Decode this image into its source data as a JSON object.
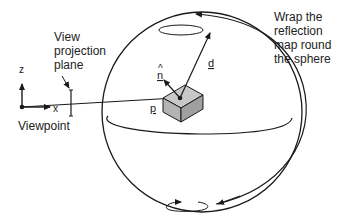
{
  "diagram": {
    "labels": {
      "view_projection_plane": [
        "View",
        "projection",
        "plane"
      ],
      "viewpoint": "Viewpoint",
      "axis_z": "z",
      "axis_x": "x",
      "normal": "n",
      "normal_hat": "^",
      "direction": "d",
      "point": "p",
      "wrap_note": [
        "Wrap the",
        "reflection",
        "map round",
        "the sphere"
      ]
    },
    "colors": {
      "stroke": "#1a1a1a",
      "box_top": "#c8c8c8",
      "box_front": "#b4b4b4",
      "box_side": "#a0a0a0",
      "background": "#ffffff"
    }
  }
}
